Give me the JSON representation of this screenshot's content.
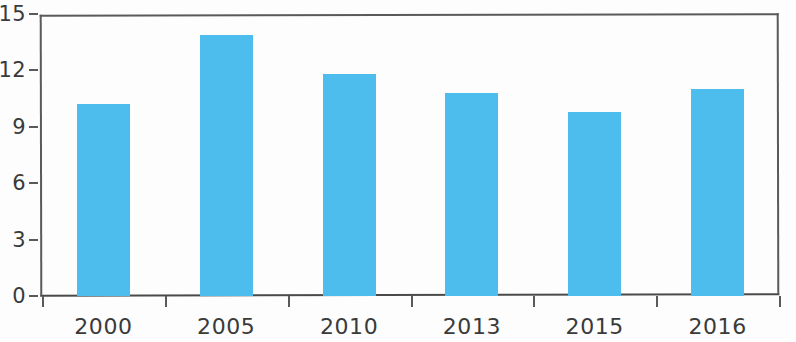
{
  "chart_data": {
    "type": "bar",
    "title": "",
    "subtitle": "",
    "xlabel": "",
    "ylabel": "",
    "categories": [
      "2000",
      "2005",
      "2010",
      "2013",
      "2015",
      "2016"
    ],
    "values": [
      10.2,
      13.9,
      11.8,
      10.8,
      9.8,
      11.0
    ],
    "series": [
      {
        "name": "",
        "values": [
          10.2,
          13.9,
          11.8,
          10.8,
          9.8,
          11.0
        ]
      }
    ],
    "ylim": [
      0,
      15
    ],
    "y_ticks": [
      0,
      3,
      6,
      9,
      12,
      15
    ],
    "y_tick_labels": [
      "0",
      "3",
      "6",
      "9",
      "12",
      "15"
    ],
    "x_tick_labels": [
      "2000",
      "2005",
      "2010",
      "2013",
      "2015",
      "2016"
    ],
    "grid": false,
    "legend": null,
    "legend_position": "none",
    "annotations": [],
    "bar_color": "#4dbdee",
    "axis_color": "#5a5a5a",
    "text_color": "#3a3a3a",
    "background_color": "#fdfdfd"
  }
}
